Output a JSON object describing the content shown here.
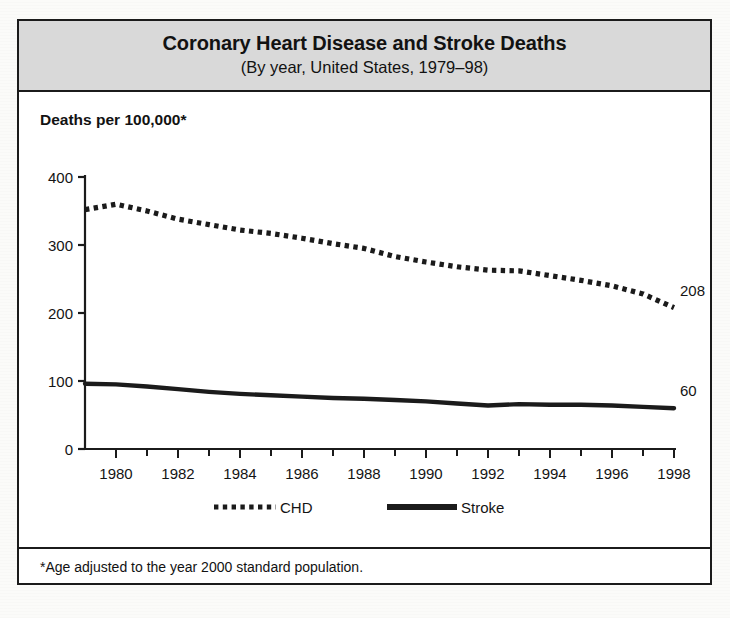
{
  "figure": {
    "title": "Coronary Heart Disease and Stroke Deaths",
    "subtitle": "(By year, United States, 1979–98)",
    "ylabel": "Deaths per 100,000*",
    "footnote": "*Age adjusted to the year 2000 standard population."
  },
  "colors": {
    "ink": "#1b1b1b",
    "title_band": "#d9d9d9",
    "paper": "#ffffff",
    "chd_line": "#141414",
    "stroke_line": "#141414"
  },
  "chart_data": {
    "type": "line",
    "title": "Coronary Heart Disease and Stroke Deaths",
    "subtitle": "(By year, United States, 1979–98)",
    "xlabel": "",
    "ylabel": "Deaths per 100,000*",
    "footnote": "*Age adjusted to the year 2000 standard population.",
    "grid": false,
    "legend_position": "bottom",
    "xlim": [
      1979,
      1998
    ],
    "ylim": [
      0,
      400
    ],
    "ytick_values": [
      0,
      100,
      200,
      300,
      400
    ],
    "ytick_labels": [
      "0",
      "100",
      "200",
      "300",
      "400"
    ],
    "xtick_values": [
      1980,
      1982,
      1984,
      1986,
      1988,
      1990,
      1992,
      1994,
      1996,
      1998
    ],
    "xtick_labels": [
      "1980",
      "1982",
      "1984",
      "1986",
      "1988",
      "1990",
      "1992",
      "1994",
      "1996",
      "1998"
    ],
    "x_minor_ticks_every": 1,
    "x": [
      1979,
      1980,
      1981,
      1982,
      1983,
      1984,
      1985,
      1986,
      1987,
      1988,
      1989,
      1990,
      1991,
      1992,
      1993,
      1994,
      1995,
      1996,
      1997,
      1998
    ],
    "series": [
      {
        "name": "CHD",
        "style": "dotted",
        "end_label": "208",
        "values": [
          352,
          360,
          350,
          338,
          330,
          322,
          317,
          310,
          302,
          295,
          283,
          275,
          268,
          263,
          262,
          255,
          248,
          240,
          228,
          208
        ]
      },
      {
        "name": "Stroke",
        "style": "solid",
        "end_label": "60",
        "values": [
          96,
          95,
          92,
          88,
          84,
          81,
          79,
          77,
          75,
          74,
          72,
          70,
          67,
          64,
          66,
          65,
          65,
          64,
          62,
          60
        ]
      }
    ],
    "annotations": [
      {
        "text": "208",
        "series": "CHD",
        "x": 1998,
        "y": 208
      },
      {
        "text": "60",
        "series": "Stroke",
        "x": 1998,
        "y": 60
      }
    ]
  },
  "legend": {
    "items": [
      {
        "label": "CHD",
        "style": "dotted"
      },
      {
        "label": "Stroke",
        "style": "solid"
      }
    ]
  }
}
